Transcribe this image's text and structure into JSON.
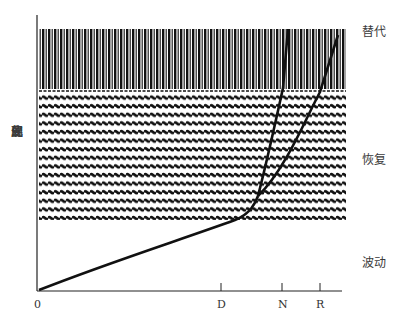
{
  "figure": {
    "y_axis_label": "展现的变化",
    "y_axis_chars": [
      "展",
      "现",
      "的",
      "变",
      "化"
    ],
    "zones": [
      {
        "id": "replacement",
        "label": "替代",
        "pattern": "vertical-bars"
      },
      {
        "id": "recovery",
        "label": "恢复",
        "pattern": "horizontal-wavy-lines"
      },
      {
        "id": "fluctuation",
        "label": "波动",
        "pattern": "none"
      }
    ],
    "x_ticks": [
      "0",
      "D",
      "N",
      "R"
    ],
    "curves": [
      "main-curve",
      "branch-N",
      "branch-R"
    ],
    "colors": {
      "ink": "#111111",
      "background": "#ffffff",
      "label": "#3a3a3a"
    }
  }
}
